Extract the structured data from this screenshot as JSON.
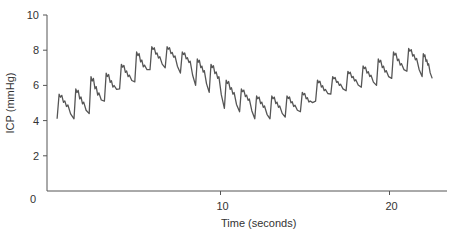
{
  "chart_data": {
    "type": "line",
    "title": "",
    "xlabel": "Time (seconds)",
    "ylabel": "ICP (mmHg)",
    "xlim": [
      0,
      23.3
    ],
    "ylim": [
      0,
      10
    ],
    "xticks": [
      10,
      20
    ],
    "xtick_labels": [
      "10",
      "20"
    ],
    "yticks": [
      0,
      2,
      4,
      6,
      8,
      10
    ],
    "ytick_labels": [
      "0",
      "2",
      "4",
      "6",
      "8",
      "10"
    ],
    "grid": false,
    "legend": null,
    "line_color": "#555555",
    "series": [
      {
        "name": "ICP waveform",
        "description": "Pulsatile intracranial pressure trace with cardiac pulses (~0.9 s period) modulated by a slow respiratory wave",
        "beats": [
          {
            "t": 0.3,
            "peak": 5.5,
            "trough": 4.1
          },
          {
            "t": 1.3,
            "peak": 5.8,
            "trough": 4.1
          },
          {
            "t": 2.2,
            "peak": 6.5,
            "trough": 4.4
          },
          {
            "t": 3.1,
            "peak": 6.7,
            "trough": 5.1
          },
          {
            "t": 4.0,
            "peak": 7.2,
            "trough": 5.8
          },
          {
            "t": 4.9,
            "peak": 7.9,
            "trough": 6.2
          },
          {
            "t": 5.8,
            "peak": 8.2,
            "trough": 6.9
          },
          {
            "t": 6.7,
            "peak": 8.2,
            "trough": 7.0
          },
          {
            "t": 7.6,
            "peak": 7.9,
            "trough": 6.7
          },
          {
            "t": 8.5,
            "peak": 7.5,
            "trough": 6.0
          },
          {
            "t": 9.3,
            "peak": 7.2,
            "trough": 5.6
          },
          {
            "t": 10.2,
            "peak": 6.3,
            "trough": 4.7
          },
          {
            "t": 11.1,
            "peak": 5.8,
            "trough": 4.5
          },
          {
            "t": 12.0,
            "peak": 5.4,
            "trough": 4.1
          },
          {
            "t": 12.9,
            "peak": 5.4,
            "trough": 4.1
          },
          {
            "t": 13.8,
            "peak": 5.4,
            "trough": 4.2
          },
          {
            "t": 14.7,
            "peak": 5.6,
            "trough": 4.5
          },
          {
            "t": 15.6,
            "peak": 6.3,
            "trough": 5.1
          },
          {
            "t": 16.5,
            "peak": 6.5,
            "trough": 5.5
          },
          {
            "t": 17.4,
            "peak": 6.8,
            "trough": 5.7
          },
          {
            "t": 18.3,
            "peak": 7.1,
            "trough": 5.9
          },
          {
            "t": 19.2,
            "peak": 7.5,
            "trough": 6.0
          },
          {
            "t": 20.1,
            "peak": 7.9,
            "trough": 6.4
          },
          {
            "t": 21.0,
            "peak": 8.1,
            "trough": 6.8
          },
          {
            "t": 21.9,
            "peak": 7.8,
            "trough": 6.5
          }
        ],
        "end": {
          "t": 22.5,
          "value": 6.4
        }
      }
    ]
  }
}
